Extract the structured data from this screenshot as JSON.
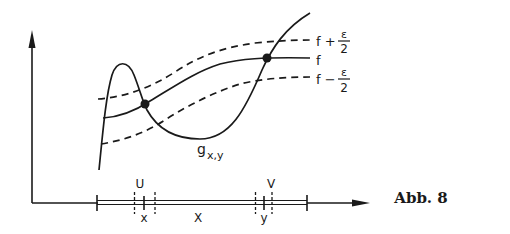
{
  "figure": {
    "caption": "Abb. 8",
    "stroke_color": "#1a1a1a",
    "background": "#ffffff"
  },
  "curves": {
    "upper": {
      "label_main": "f +",
      "label_num": "ε",
      "label_den": "2",
      "style": "dashed"
    },
    "middle": {
      "label": "f",
      "style": "solid"
    },
    "lower": {
      "label_main": "f −",
      "label_num": "ε",
      "label_den": "2",
      "style": "dashed"
    },
    "g": {
      "label_base": "g",
      "label_sub": "x,y",
      "style": "solid"
    }
  },
  "axis": {
    "neighborhood_left": "U",
    "neighborhood_right": "V",
    "point_left": "x",
    "point_right": "y",
    "set_label": "X"
  },
  "intersection_points": [
    {
      "name": "left-dot",
      "cx": 145,
      "cy": 104
    },
    {
      "name": "right-dot",
      "cx": 267,
      "cy": 58
    }
  ]
}
